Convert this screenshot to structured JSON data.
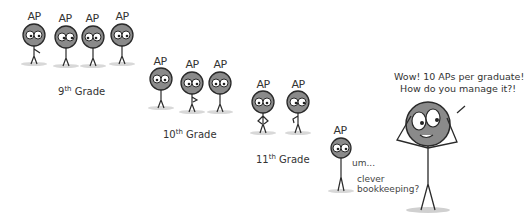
{
  "comic": {
    "background": "#ffffff",
    "head_color": "#8a8a8a",
    "line_color": "#2a2a2a",
    "groups": [
      {
        "grade_num": "9",
        "grade_suffix": "th",
        "grade_word": "Grade",
        "figures": [
          {
            "label": "AP"
          },
          {
            "label": "AP"
          },
          {
            "label": "AP"
          },
          {
            "label": "AP"
          }
        ]
      },
      {
        "grade_num": "10",
        "grade_suffix": "th",
        "grade_word": "Grade",
        "figures": [
          {
            "label": "AP"
          },
          {
            "label": "AP"
          },
          {
            "label": "AP"
          }
        ]
      },
      {
        "grade_num": "11",
        "grade_suffix": "th",
        "grade_word": "Grade",
        "figures": [
          {
            "label": "AP"
          },
          {
            "label": "AP"
          }
        ]
      },
      {
        "figures": [
          {
            "label": "AP"
          }
        ],
        "mutter": "um...",
        "reply_line1": "clever",
        "reply_line2": "bookkeeping?"
      }
    ],
    "speaker": {
      "line1": "Wow! 10 APs per graduate!",
      "line2": "How do you manage it?!"
    }
  }
}
